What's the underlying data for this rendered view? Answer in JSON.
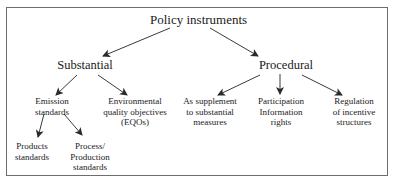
{
  "diagram": {
    "root": {
      "label": "Policy instruments"
    },
    "substantial": {
      "label": "Substantial",
      "children": {
        "emission": {
          "lines": [
            "Emission",
            "standards"
          ]
        },
        "eqo": {
          "lines": [
            "Environmental",
            "quality objectives",
            "(EQOs)"
          ]
        }
      },
      "emission_children": {
        "products": {
          "lines": [
            "Products",
            "standards"
          ]
        },
        "process": {
          "lines": [
            "Process/",
            "Production",
            "standards"
          ]
        }
      }
    },
    "procedural": {
      "label": "Procedural",
      "children": {
        "supplement": {
          "lines": [
            "As supplement",
            "to substantial",
            "measures"
          ]
        },
        "participation": {
          "lines": [
            "Participation",
            "Information",
            "rights"
          ]
        },
        "regulation": {
          "lines": [
            "Regulation",
            "of incentive",
            "structures"
          ]
        }
      }
    },
    "colors": {
      "line": "#3a3a3a",
      "border": "#6e6e6e",
      "text": "#1a1a1a"
    }
  }
}
